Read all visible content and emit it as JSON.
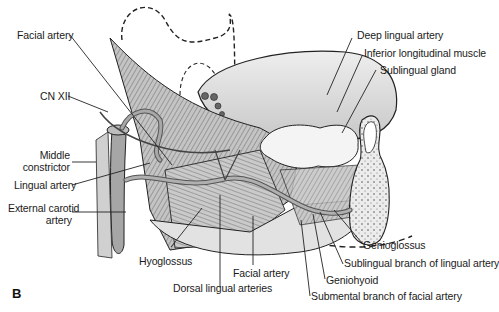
{
  "figure": {
    "panel_label": "B",
    "labels": {
      "facial_artery_top": "Facial artery",
      "cn_xii": "CN XII",
      "middle_constrictor_1": "Middle",
      "middle_constrictor_2": "constrictor",
      "lingual_artery": "Lingual artery",
      "external_carotid_1": "External carotid",
      "external_carotid_2": "artery",
      "deep_lingual_artery": "Deep lingual artery",
      "inferior_longitudinal_muscle": "Inferior longitudinal muscle",
      "sublingual_gland": "Sublingual gland",
      "hyoglossus": "Hyoglossus",
      "facial_artery_bottom": "Facial artery",
      "dorsal_lingual_arteries": "Dorsal lingual arteries",
      "genioglossus": "Genioglossus",
      "sublingual_branch": "Sublingual branch of lingual artery",
      "geniohyoid": "Geniohyoid",
      "submental_branch": "Submental branch of facial artery"
    },
    "colors": {
      "line": "#222222",
      "tongue_fill": "#d9d9d9",
      "muscle_fill": "#bdbdbd",
      "artery_fill": "#9e9e9e",
      "gland_fill": "#f2f2f2",
      "bone_fill": "#e6e6e6"
    }
  }
}
